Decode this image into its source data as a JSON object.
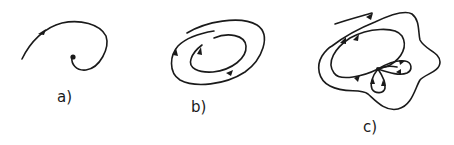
{
  "figure": {
    "panels": [
      {
        "id": "a",
        "label": "a)",
        "description": "spiral trajectory converging to a stable focus point"
      },
      {
        "id": "b",
        "label": "b)",
        "description": "nested elliptical orbits spiraling toward a limit cycle"
      },
      {
        "id": "c",
        "label": "c)",
        "description": "trajectory approaching a closed loop containing a saddle-like point with petal loops"
      }
    ],
    "colors": {
      "stroke": "#1a1a1a",
      "background": "#ffffff"
    }
  }
}
